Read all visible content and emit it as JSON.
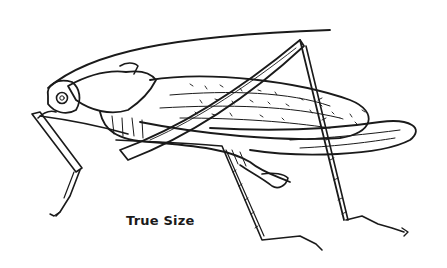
{
  "illustration": {
    "subject": "katydid line drawing",
    "caption": "True Size",
    "ink_color": "#1a1a1a",
    "paper_color": "#ffffff"
  }
}
